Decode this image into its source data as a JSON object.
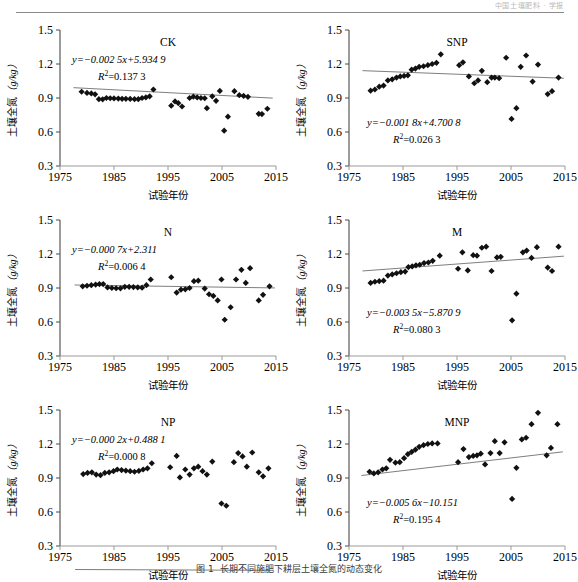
{
  "header": {
    "running_head": "中国土壤肥料 · 学报"
  },
  "figure": {
    "caption_number": "图 1",
    "caption_text": "长期不同施肥下耕层土壤全氮的动态变化"
  },
  "axes": {
    "x_label": "试验年份",
    "y_label_cjk": "土壤全氮",
    "y_label_unit": "（g/kg）",
    "x_ticks": [
      "1975",
      "1985",
      "1995",
      "2005",
      "2015"
    ],
    "y_ticks": [
      "0.3",
      "0.6",
      "0.9",
      "1.2",
      "1.5"
    ],
    "xlim": [
      1975,
      2015
    ],
    "ylim": [
      0.3,
      1.5
    ]
  },
  "chart_data": [
    {
      "type": "scatter",
      "id": "ck",
      "title": "CK",
      "equation": "y=−0.002 5x+5.934 9",
      "r2": "R2=0.137 3",
      "slope": -0.0025,
      "intercept": 5.9349,
      "r_squared": 0.1373,
      "xlabel": "试验年份",
      "ylabel": "土壤全氮（g/kg）",
      "xlim": [
        1975,
        2015
      ],
      "ylim": [
        0.3,
        1.5
      ],
      "points": [
        [
          1979.0,
          0.955
        ],
        [
          1980.0,
          0.945
        ],
        [
          1980.8,
          0.94
        ],
        [
          1981.5,
          0.932
        ],
        [
          1982.2,
          0.89
        ],
        [
          1982.9,
          0.888
        ],
        [
          1983.6,
          0.9
        ],
        [
          1984.3,
          0.898
        ],
        [
          1985.0,
          0.896
        ],
        [
          1985.8,
          0.895
        ],
        [
          1986.5,
          0.893
        ],
        [
          1987.2,
          0.893
        ],
        [
          1988.0,
          0.892
        ],
        [
          1988.8,
          0.89
        ],
        [
          1989.5,
          0.89
        ],
        [
          1990.2,
          0.9
        ],
        [
          1990.9,
          0.905
        ],
        [
          1991.6,
          0.915
        ],
        [
          1992.3,
          0.975
        ],
        [
          1995.6,
          0.832
        ],
        [
          1996.3,
          0.87
        ],
        [
          1996.9,
          0.855
        ],
        [
          1997.6,
          0.825
        ],
        [
          1999.0,
          0.9
        ],
        [
          1999.7,
          0.912
        ],
        [
          2000.4,
          0.905
        ],
        [
          2001.1,
          0.9
        ],
        [
          2001.8,
          0.898
        ],
        [
          2002.2,
          0.81
        ],
        [
          2003.2,
          0.915
        ],
        [
          2003.9,
          0.875
        ],
        [
          2004.6,
          0.962
        ],
        [
          2005.4,
          0.612
        ],
        [
          2006.1,
          0.735
        ],
        [
          2007.3,
          0.96
        ],
        [
          2008.2,
          0.925
        ],
        [
          2009.0,
          0.918
        ],
        [
          2009.8,
          0.91
        ],
        [
          2011.8,
          0.76
        ],
        [
          2012.4,
          0.758
        ],
        [
          2013.4,
          0.805
        ]
      ]
    },
    {
      "type": "scatter",
      "id": "snp",
      "title": "SNP",
      "equation": "y=−0.001 8x+4.700 8",
      "r2": "R2=0.026 3",
      "slope": -0.0018,
      "intercept": 4.7008,
      "r_squared": 0.0263,
      "xlabel": "试验年份",
      "ylabel": "土壤全氮（g/kg）",
      "xlim": [
        1975,
        2015
      ],
      "ylim": [
        0.3,
        1.5
      ],
      "points": [
        [
          1979.0,
          0.965
        ],
        [
          1979.8,
          0.975
        ],
        [
          1980.6,
          1.0
        ],
        [
          1981.4,
          1.01
        ],
        [
          1982.2,
          1.055
        ],
        [
          1983.0,
          1.065
        ],
        [
          1983.8,
          1.08
        ],
        [
          1984.5,
          1.09
        ],
        [
          1985.2,
          1.095
        ],
        [
          1985.9,
          1.1
        ],
        [
          1986.6,
          1.15
        ],
        [
          1987.3,
          1.16
        ],
        [
          1988.0,
          1.175
        ],
        [
          1988.8,
          1.18
        ],
        [
          1989.6,
          1.19
        ],
        [
          1990.4,
          1.2
        ],
        [
          1991.2,
          1.21
        ],
        [
          1992.0,
          1.285
        ],
        [
          1995.4,
          1.19
        ],
        [
          1996.1,
          1.215
        ],
        [
          1997.2,
          1.09
        ],
        [
          1998.2,
          1.03
        ],
        [
          1998.9,
          1.055
        ],
        [
          1999.6,
          1.14
        ],
        [
          2000.6,
          1.04
        ],
        [
          2001.4,
          1.08
        ],
        [
          2002.0,
          1.08
        ],
        [
          2002.8,
          1.075
        ],
        [
          2004.1,
          1.255
        ],
        [
          2005.1,
          0.715
        ],
        [
          2006.0,
          0.81
        ],
        [
          2006.8,
          1.175
        ],
        [
          2007.8,
          1.275
        ],
        [
          2009.0,
          1.045
        ],
        [
          2010.0,
          1.195
        ],
        [
          2011.8,
          0.935
        ],
        [
          2012.6,
          0.96
        ],
        [
          2013.8,
          1.08
        ]
      ]
    },
    {
      "type": "scatter",
      "id": "n",
      "title": "N",
      "equation": "y=−0.000 7x+2.311",
      "r2": "R2=0.006 4",
      "slope": -0.0007,
      "intercept": 2.311,
      "r_squared": 0.0064,
      "xlabel": "试验年份",
      "ylabel": "土壤全氮（g/kg）",
      "xlim": [
        1975,
        2015
      ],
      "ylim": [
        0.3,
        1.5
      ],
      "points": [
        [
          1979.2,
          0.915
        ],
        [
          1980.0,
          0.92
        ],
        [
          1980.8,
          0.925
        ],
        [
          1981.6,
          0.93
        ],
        [
          1982.3,
          0.935
        ],
        [
          1983.0,
          0.935
        ],
        [
          1983.8,
          0.905
        ],
        [
          1984.6,
          0.9
        ],
        [
          1985.4,
          0.898
        ],
        [
          1986.2,
          0.897
        ],
        [
          1987.0,
          0.91
        ],
        [
          1987.8,
          0.91
        ],
        [
          1988.6,
          0.908
        ],
        [
          1989.4,
          0.905
        ],
        [
          1990.2,
          0.903
        ],
        [
          1991.0,
          0.925
        ],
        [
          1991.8,
          0.975
        ],
        [
          1995.6,
          0.995
        ],
        [
          1996.6,
          0.86
        ],
        [
          1997.4,
          0.885
        ],
        [
          1998.2,
          0.888
        ],
        [
          1999.0,
          0.9
        ],
        [
          1999.8,
          0.96
        ],
        [
          2000.6,
          0.965
        ],
        [
          2001.8,
          0.895
        ],
        [
          2002.6,
          0.845
        ],
        [
          2003.4,
          0.83
        ],
        [
          2004.2,
          0.79
        ],
        [
          2004.9,
          0.975
        ],
        [
          2005.5,
          0.62
        ],
        [
          2006.6,
          0.73
        ],
        [
          2007.6,
          0.975
        ],
        [
          2008.6,
          1.06
        ],
        [
          2009.4,
          0.945
        ],
        [
          2010.2,
          1.075
        ],
        [
          2011.8,
          0.79
        ],
        [
          2012.6,
          0.84
        ],
        [
          2013.8,
          0.915
        ]
      ]
    },
    {
      "type": "scatter",
      "id": "m",
      "title": "M",
      "equation": "y=−0.003 5x−5.870 9",
      "r2": "R2=0.080 3",
      "slope": 0.0035,
      "intercept": -5.8709,
      "r_squared": 0.0803,
      "xlabel": "试验年份",
      "ylabel": "土壤全氮（g/kg）",
      "xlim": [
        1975,
        2015
      ],
      "ylim": [
        0.3,
        1.5
      ],
      "points": [
        [
          1979.0,
          0.945
        ],
        [
          1979.8,
          0.955
        ],
        [
          1980.6,
          0.96
        ],
        [
          1981.4,
          0.965
        ],
        [
          1982.2,
          1.01
        ],
        [
          1983.0,
          1.02
        ],
        [
          1983.8,
          1.03
        ],
        [
          1984.6,
          1.04
        ],
        [
          1985.4,
          1.045
        ],
        [
          1986.0,
          1.085
        ],
        [
          1986.7,
          1.09
        ],
        [
          1987.4,
          1.1
        ],
        [
          1988.1,
          1.105
        ],
        [
          1988.9,
          1.12
        ],
        [
          1989.7,
          1.125
        ],
        [
          1990.5,
          1.14
        ],
        [
          1991.8,
          1.185
        ],
        [
          1995.2,
          1.07
        ],
        [
          1996.0,
          1.215
        ],
        [
          1997.0,
          1.055
        ],
        [
          1998.0,
          1.19
        ],
        [
          1998.7,
          1.185
        ],
        [
          1999.6,
          1.255
        ],
        [
          2000.4,
          1.265
        ],
        [
          2001.4,
          1.05
        ],
        [
          2002.4,
          1.17
        ],
        [
          2003.1,
          1.175
        ],
        [
          2005.2,
          0.615
        ],
        [
          2006.0,
          0.85
        ],
        [
          2007.2,
          1.215
        ],
        [
          2007.9,
          1.23
        ],
        [
          2008.8,
          1.165
        ],
        [
          2009.8,
          1.26
        ],
        [
          2011.8,
          1.08
        ],
        [
          2012.6,
          1.05
        ],
        [
          2013.8,
          1.265
        ]
      ]
    },
    {
      "type": "scatter",
      "id": "np",
      "title": "NP",
      "equation": "y=−0.000 2x+0.488 1",
      "r2": "R2=0.000 8",
      "slope": -0.0002,
      "intercept": 0.4881,
      "r_squared": 0.0008,
      "xlabel": "试验年份",
      "ylabel": "土壤全氮（g/kg）",
      "xlim": [
        1975,
        2015
      ],
      "ylim": [
        0.3,
        1.5
      ],
      "points": [
        [
          1979.3,
          0.935
        ],
        [
          1980.1,
          0.945
        ],
        [
          1980.9,
          0.95
        ],
        [
          1981.7,
          0.93
        ],
        [
          1982.5,
          0.925
        ],
        [
          1983.3,
          0.945
        ],
        [
          1984.1,
          0.95
        ],
        [
          1984.9,
          0.96
        ],
        [
          1985.6,
          0.975
        ],
        [
          1986.4,
          0.97
        ],
        [
          1987.2,
          0.965
        ],
        [
          1988.0,
          0.96
        ],
        [
          1988.8,
          0.955
        ],
        [
          1989.6,
          0.962
        ],
        [
          1990.4,
          0.975
        ],
        [
          1991.2,
          0.985
        ],
        [
          1992.0,
          1.03
        ],
        [
          1995.4,
          0.995
        ],
        [
          1996.6,
          1.095
        ],
        [
          1997.2,
          0.905
        ],
        [
          1998.2,
          0.975
        ],
        [
          1999.0,
          0.93
        ],
        [
          1999.8,
          0.985
        ],
        [
          2000.6,
          1.0
        ],
        [
          2001.4,
          0.96
        ],
        [
          2002.2,
          0.93
        ],
        [
          2003.2,
          1.045
        ],
        [
          2004.9,
          0.675
        ],
        [
          2005.8,
          0.655
        ],
        [
          2007.2,
          1.04
        ],
        [
          2008.0,
          1.12
        ],
        [
          2008.8,
          1.09
        ],
        [
          2009.6,
          1.0
        ],
        [
          2010.6,
          1.125
        ],
        [
          2011.8,
          0.95
        ],
        [
          2012.6,
          0.915
        ],
        [
          2013.6,
          0.985
        ]
      ]
    },
    {
      "type": "scatter",
      "id": "mnp",
      "title": "MNP",
      "equation": "y=−0.005 6x−10.151",
      "r2": "R2=0.195 4",
      "slope": 0.0056,
      "intercept": -10.151,
      "r_squared": 0.1954,
      "xlabel": "试验年份",
      "ylabel": "土壤全氮（g/kg）",
      "xlim": [
        1975,
        2015
      ],
      "ylim": [
        0.3,
        1.5
      ],
      "points": [
        [
          1978.8,
          0.955
        ],
        [
          1979.6,
          0.94
        ],
        [
          1980.4,
          0.95
        ],
        [
          1981.2,
          0.975
        ],
        [
          1981.9,
          0.985
        ],
        [
          1982.6,
          1.06
        ],
        [
          1983.6,
          1.035
        ],
        [
          1984.4,
          1.04
        ],
        [
          1985.2,
          1.075
        ],
        [
          1985.9,
          1.11
        ],
        [
          1986.6,
          1.13
        ],
        [
          1987.3,
          1.15
        ],
        [
          1988.0,
          1.175
        ],
        [
          1988.8,
          1.19
        ],
        [
          1989.6,
          1.2
        ],
        [
          1990.4,
          1.205
        ],
        [
          1991.4,
          1.205
        ],
        [
          1995.2,
          1.04
        ],
        [
          1996.2,
          1.155
        ],
        [
          1997.2,
          1.085
        ],
        [
          1998.0,
          1.095
        ],
        [
          1998.7,
          1.1
        ],
        [
          1999.4,
          1.115
        ],
        [
          2000.2,
          1.02
        ],
        [
          2001.2,
          1.12
        ],
        [
          2002.0,
          1.225
        ],
        [
          2002.9,
          1.12
        ],
        [
          2003.8,
          1.215
        ],
        [
          2005.2,
          0.715
        ],
        [
          2006.0,
          0.99
        ],
        [
          2007.0,
          1.24
        ],
        [
          2007.8,
          1.255
        ],
        [
          2008.8,
          1.375
        ],
        [
          2010.0,
          1.475
        ],
        [
          2011.6,
          1.1
        ],
        [
          2012.4,
          1.165
        ],
        [
          2013.6,
          1.375
        ]
      ]
    }
  ]
}
